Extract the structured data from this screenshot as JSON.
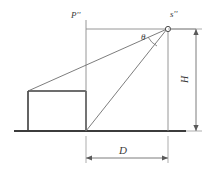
{
  "figure": {
    "title_visible": false,
    "background_color": "#ffffff",
    "line_color_thin": "#6e6e6e",
    "line_color_thick": "#3c3c3c",
    "label_color": "#3a3a3a",
    "labels": {
      "principal_point": "P''",
      "source_point": "s''",
      "angle": "θ",
      "height": "H",
      "distance": "D"
    },
    "geometry": {
      "ground_line": {
        "x1": 14,
        "y1": 131,
        "x2": 186,
        "y2": 131
      },
      "box": {
        "x": 27,
        "y": 91,
        "width": 59,
        "height": 40
      },
      "vertical_principal": {
        "x": 86,
        "y_top": 20,
        "y_bottom": 131
      },
      "vertical_source": {
        "x": 168,
        "y_top": 29,
        "y_bottom": 131
      },
      "horizon_line": {
        "x1": 86,
        "y1": 29,
        "x2": 196,
        "y2": 29
      },
      "sight_line_upper": {
        "x1": 27,
        "y1": 91,
        "x2": 168,
        "y2": 29
      },
      "sight_line_lower": {
        "x1": 86,
        "y1": 131,
        "x2": 168,
        "y2": 29
      },
      "source_marker": {
        "cx": 168,
        "cy": 29,
        "r": 2.6
      },
      "dimension_H": {
        "x": 196,
        "y_top": 29,
        "y_bottom": 131
      },
      "dimension_D": {
        "y": 158,
        "x_left": 86,
        "x_right": 168
      }
    }
  }
}
